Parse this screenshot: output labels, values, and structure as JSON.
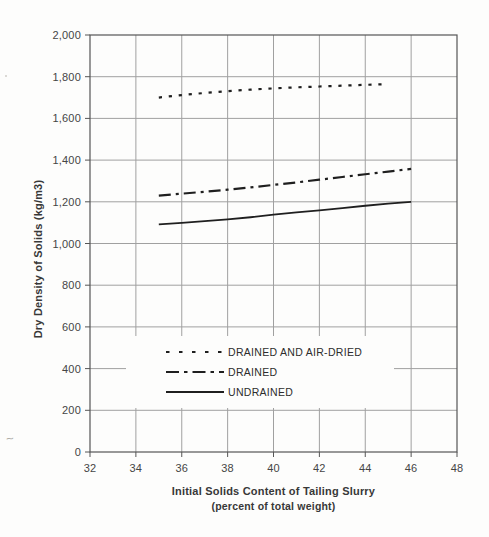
{
  "chart_data": {
    "type": "line",
    "title": "",
    "xlabel": "Initial Solids Content of Tailing Slurry",
    "xlabel_sub": "(percent of total weight)",
    "ylabel": "Dry Density of Solids (kg/m3)",
    "xlim": [
      32,
      48
    ],
    "ylim": [
      0,
      2000
    ],
    "x_ticks": [
      32,
      34,
      36,
      38,
      40,
      42,
      44,
      46,
      48
    ],
    "y_ticks": [
      {
        "value": 0,
        "label": "0"
      },
      {
        "value": 200,
        "label": "200"
      },
      {
        "value": 400,
        "label": "400"
      },
      {
        "value": 600,
        "label": "600"
      },
      {
        "value": 800,
        "label": "800"
      },
      {
        "value": 1000,
        "label": "1,000"
      },
      {
        "value": 1200,
        "label": "1,200"
      },
      {
        "value": 1400,
        "label": "1,400"
      },
      {
        "value": 1600,
        "label": "1,600"
      },
      {
        "value": 1800,
        "label": "1,800"
      },
      {
        "value": 2000,
        "label": "2,000"
      }
    ],
    "grid": true,
    "legend_position": "inside-bottom-left",
    "line_color": "#1f1f1f",
    "grid_color": "#a0a0a0",
    "axis_color": "#555555",
    "series": [
      {
        "name": "DRAINED AND AIR-DRIED",
        "style": "dotted",
        "x": [
          35,
          36,
          37,
          38,
          39,
          40,
          41,
          42,
          43,
          44,
          45
        ],
        "y": [
          1700,
          1712,
          1722,
          1731,
          1738,
          1744,
          1749,
          1753,
          1757,
          1761,
          1764
        ]
      },
      {
        "name": "DRAINED",
        "style": "dashdot",
        "x": [
          35,
          36,
          37,
          38,
          39,
          40,
          41,
          42,
          43,
          44,
          45,
          46
        ],
        "y": [
          1230,
          1239,
          1248,
          1258,
          1269,
          1281,
          1293,
          1306,
          1319,
          1332,
          1345,
          1358
        ]
      },
      {
        "name": "UNDRAINED",
        "style": "solid",
        "x": [
          35,
          36,
          37,
          38,
          39,
          40,
          41,
          42,
          43,
          44,
          45,
          46
        ],
        "y": [
          1092,
          1099,
          1107,
          1116,
          1126,
          1138,
          1149,
          1159,
          1170,
          1181,
          1191,
          1200
        ]
      }
    ]
  }
}
